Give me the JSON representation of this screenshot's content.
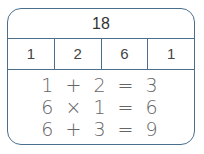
{
  "total": "18",
  "parts": [
    "1",
    "2",
    "6",
    "1"
  ],
  "equations": [
    "1 + 2 = 3",
    "6 × 1 = 6",
    "6 + 3 = 9"
  ],
  "colors": {
    "border": "#4a6f8c",
    "text": "#444444"
  }
}
